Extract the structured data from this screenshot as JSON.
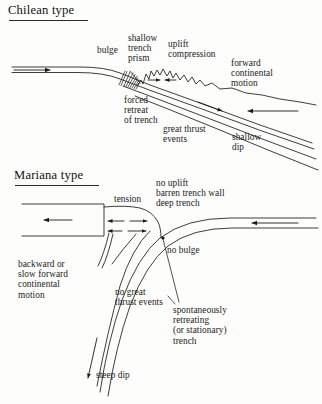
{
  "figure": {
    "kind": "geology-cross-section-diagram",
    "background_color": "#fdfdfb",
    "ink_color": "#1b1b1b"
  },
  "panels": [
    {
      "id": "chilean",
      "heading": "Chilean type",
      "labels": {
        "bulge": "bulge",
        "shallow_trench_prism": "shallow\ntrench\nprism",
        "uplift_compression": "uplift\ncompression",
        "forward_continental_motion": "forward\ncontinental\nmotion",
        "forced_retreat_of_trench": "forced\nretreat\nof trench",
        "great_thrust_events": "great thrust\nevents",
        "shallow_dip": "shallow\ndip"
      }
    },
    {
      "id": "mariana",
      "heading": "Mariana type",
      "labels": {
        "tension": "tension",
        "no_uplift_barren_deep": "no uplift\nbarren trench wall\ndeep trench",
        "no_bulge": "no bulge",
        "backward_motion": "backward or\nslow forward\ncontinental\nmotion",
        "no_great_thrust_events": "no great\nthrust events",
        "spontaneously_retreating": "spontaneously\nretreating\n(or stationary)\ntrench",
        "steep_dip": "steep dip"
      }
    }
  ]
}
